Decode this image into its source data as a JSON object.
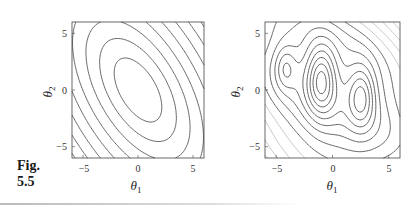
{
  "figure": {
    "label_line1": "Fig.",
    "label_line2": "5.5"
  },
  "chart_data": [
    {
      "type": "contour",
      "title": "",
      "description": "Contour plot of a convex quadratic objective; nested tilted ellipses centred near (0,0), major axis oriented from upper-left to lower-right",
      "xlabel": "θ1",
      "ylabel": "θ2",
      "xlim": [
        -6,
        6
      ],
      "ylim": [
        -6,
        6
      ],
      "xticks": [
        -5,
        0,
        5
      ],
      "yticks": [
        -5,
        0,
        5
      ],
      "xtick_labels": [
        "−5",
        "0",
        "5"
      ],
      "ytick_labels": [
        "−5",
        "0",
        "5"
      ],
      "minima": [
        [
          0,
          0
        ]
      ],
      "grid": false,
      "legend": null,
      "contour_color": "#555555"
    },
    {
      "type": "contour",
      "title": "",
      "description": "Contour plot of a non-convex objective with three local minima (ovals) near (-4,2), (-1,1) and (2.5,-0.5)",
      "xlabel": "θ1",
      "ylabel": "θ2",
      "xlim": [
        -6,
        6
      ],
      "ylim": [
        -6,
        6
      ],
      "xticks": [
        -5,
        0,
        5
      ],
      "yticks": [
        -5,
        0,
        5
      ],
      "xtick_labels": [
        "−5",
        "0",
        "5"
      ],
      "ytick_labels": [
        "−5",
        "0",
        "5"
      ],
      "minima": [
        [
          -4.2,
          2
        ],
        [
          -1,
          1
        ],
        [
          2.5,
          -0.5
        ]
      ],
      "grid": false,
      "legend": null,
      "contour_color": "#555555"
    }
  ]
}
